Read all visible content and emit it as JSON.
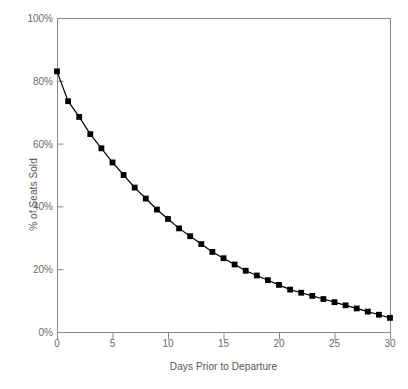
{
  "chart_data": {
    "type": "line",
    "title": "",
    "xlabel": "Days Prior to Departure",
    "ylabel": "% of Seats Sold",
    "xlim": [
      0,
      30
    ],
    "ylim": [
      0,
      100
    ],
    "grid": false,
    "legend": null,
    "xticks": [
      0,
      5,
      10,
      15,
      20,
      25,
      30
    ],
    "xtick_labels": [
      "0",
      "5",
      "10",
      "15",
      "20",
      "25",
      "30"
    ],
    "yticks": [
      0,
      20,
      40,
      60,
      80,
      100
    ],
    "ytick_labels": [
      "0%",
      "20%",
      "40%",
      "60%",
      "80%",
      "100%"
    ],
    "marker": "square",
    "marker_color": "#000000",
    "line_color": "#000000",
    "axis_color": "#888888",
    "x": [
      0,
      1,
      2,
      3,
      4,
      5,
      6,
      7,
      8,
      9,
      10,
      11,
      12,
      13,
      14,
      15,
      16,
      17,
      18,
      19,
      20,
      21,
      22,
      23,
      24,
      25,
      26,
      27,
      28,
      29,
      30
    ],
    "series": [
      {
        "name": "% of Seats Sold",
        "values": [
          83.0,
          73.5,
          68.5,
          63.0,
          58.5,
          54.0,
          50.0,
          46.0,
          42.5,
          39.0,
          36.0,
          33.0,
          30.5,
          28.0,
          25.5,
          23.5,
          21.5,
          19.5,
          18.0,
          16.5,
          15.0,
          13.5,
          12.5,
          11.5,
          10.5,
          9.5,
          8.5,
          7.5,
          6.5,
          5.5,
          4.5
        ]
      }
    ]
  }
}
